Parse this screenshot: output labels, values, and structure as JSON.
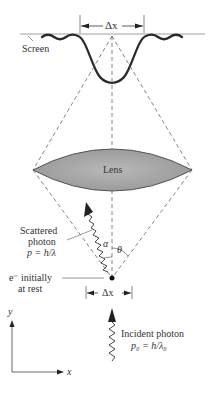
{
  "diagram": {
    "labels": {
      "screen": "Screen",
      "delta_x_top": "Δx",
      "lens": "Lens",
      "scattered_photon_line1": "Scattered",
      "scattered_photon_line2": "photon",
      "scattered_momentum": "p = h/λ",
      "alpha": "α",
      "theta": "θ",
      "electron_line1": "e⁻ initially",
      "electron_line2": "at rest",
      "delta_x_bottom": "Δx",
      "incident_photon": "Incident photon",
      "incident_momentum": "p₀ = h/λ₀",
      "axis_y": "y",
      "axis_x": "x"
    },
    "colors": {
      "lens_fill": "#a8a8a8",
      "lens_stroke": "#555555",
      "curve": "#2a2a2a",
      "dashed": "#666666",
      "text": "#333333"
    }
  }
}
